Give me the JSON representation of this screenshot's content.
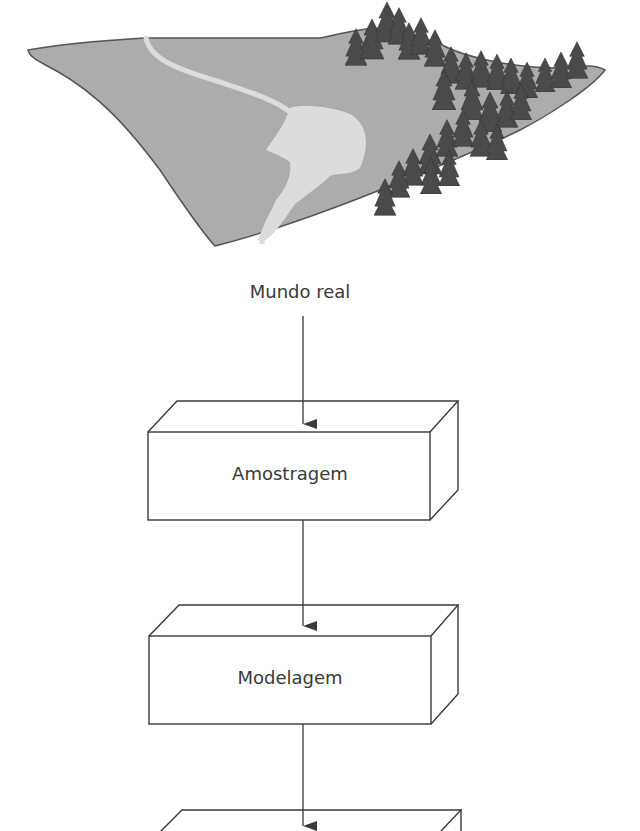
{
  "figure": {
    "colors": {
      "terrain_fill": "#acacac",
      "terrain_stroke": "#555555",
      "water": "#dcdcdc",
      "trees": "#4a4a4a",
      "box_stroke": "#3a3a3a",
      "text": "#3a3a3a"
    },
    "source_label": "Mundo real",
    "stages": [
      {
        "label": "Amostragem"
      },
      {
        "label": "Modelagem"
      },
      {
        "label": ""
      }
    ]
  }
}
